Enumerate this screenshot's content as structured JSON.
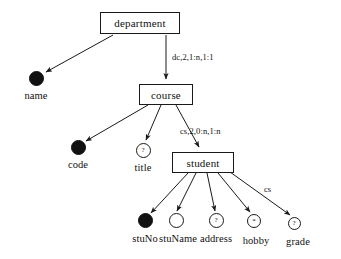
{
  "diagram": {
    "entities": [
      {
        "id": "department",
        "label": "department",
        "x": 100,
        "y": 12,
        "w": 80,
        "h": 22
      },
      {
        "id": "course",
        "label": "course",
        "x": 139,
        "y": 84,
        "w": 54,
        "h": 21
      },
      {
        "id": "student",
        "label": "student",
        "x": 172,
        "y": 152,
        "w": 62,
        "h": 21
      }
    ],
    "attributes": [
      {
        "id": "name",
        "label": "name",
        "cx": 36,
        "cy": 78,
        "r": 7.5,
        "kind": "filled",
        "glyph": "",
        "labelx": 36,
        "labely": 90
      },
      {
        "id": "code",
        "label": "code",
        "cx": 78,
        "cy": 147,
        "r": 7.5,
        "kind": "filled",
        "glyph": "",
        "labelx": 78,
        "labely": 159
      },
      {
        "id": "title",
        "label": "title",
        "cx": 143,
        "cy": 150,
        "r": 7.5,
        "kind": "open",
        "glyph": "?",
        "labelx": 143,
        "labely": 162
      },
      {
        "id": "stuNo",
        "label": "stuNo",
        "cx": 145,
        "cy": 220,
        "r": 7.5,
        "kind": "filled",
        "glyph": "",
        "labelx": 145,
        "labely": 233
      },
      {
        "id": "stuName",
        "label": "stuName",
        "cx": 176,
        "cy": 220,
        "r": 7.5,
        "kind": "open",
        "glyph": "",
        "labelx": 178,
        "labely": 233
      },
      {
        "id": "address",
        "label": "address",
        "cx": 216,
        "cy": 220,
        "r": 7.5,
        "kind": "open",
        "glyph": "?",
        "labelx": 216,
        "labely": 233
      },
      {
        "id": "hobby",
        "label": "hobby",
        "cx": 254,
        "cy": 221,
        "r": 7,
        "kind": "open",
        "glyph": "*",
        "labelx": 256,
        "labely": 235
      },
      {
        "id": "grade",
        "label": "grade",
        "cx": 294,
        "cy": 223,
        "r": 6.5,
        "kind": "open",
        "glyph": "?",
        "labelx": 298,
        "labely": 236
      }
    ],
    "edge_labels": [
      {
        "id": "dc-label",
        "text": "dc,2,1:n,1:1",
        "x": 172,
        "y": 52
      },
      {
        "id": "cs-label",
        "text": "cs,2,0:n,1:n",
        "x": 180,
        "y": 126
      },
      {
        "id": "cs-short-label",
        "text": "cs",
        "x": 264,
        "y": 184
      }
    ],
    "colors": {
      "stroke": "#1a1a1a",
      "fill_node": "#111111",
      "background": "#ffffff"
    }
  }
}
